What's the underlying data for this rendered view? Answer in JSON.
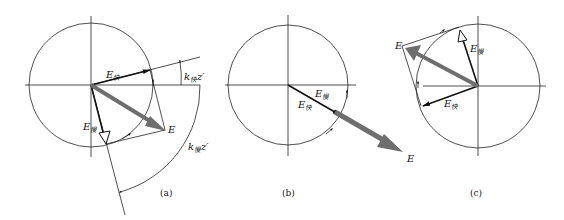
{
  "figure": {
    "panels": [
      {
        "id": "a",
        "caption": "(a)",
        "labels": {
          "E": "E",
          "E_fast": {
            "main": "E",
            "sub": "快"
          },
          "E_slow": {
            "main": "E",
            "sub": "慢"
          },
          "angle_fast": {
            "main": "k",
            "sub": "快",
            "tail": "z′"
          },
          "angle_slow": {
            "main": "k",
            "sub": "慢",
            "tail": "z′"
          }
        }
      },
      {
        "id": "b",
        "caption": "(b)",
        "labels": {
          "E": "E",
          "E_fast": {
            "main": "E",
            "sub": "快"
          },
          "E_slow": {
            "main": "E",
            "sub": "慢"
          }
        }
      },
      {
        "id": "c",
        "caption": "(c)",
        "labels": {
          "E": "E",
          "E_fast": {
            "main": "E",
            "sub": "快"
          },
          "E_slow": {
            "main": "E",
            "sub": "慢"
          }
        }
      }
    ],
    "colors": {
      "line": "#222222",
      "resultant_arrow": "#6e6e6e",
      "background": "#ffffff"
    }
  }
}
